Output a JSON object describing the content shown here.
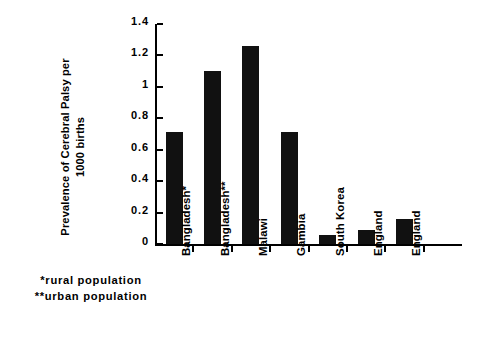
{
  "chart_data": {
    "type": "bar",
    "title": "",
    "subtitle": "",
    "xlabel": "",
    "ylabel": "Prevalence of Cerebral Palsy per\n1000 births",
    "categories": [
      "Bangladesh*",
      "Bangladesh**",
      "Malawi",
      "Gambia",
      "South Korea",
      "England",
      "England"
    ],
    "values": [
      0.71,
      1.1,
      1.26,
      0.71,
      0.06,
      0.09,
      0.16
    ],
    "ylim": [
      0,
      1.4
    ],
    "yticks": [
      0,
      0.2,
      0.4,
      0.6,
      0.8,
      1,
      1.2,
      1.4
    ],
    "ytick_labels": [
      "0",
      "0.2",
      "0.4",
      "0.6",
      "0.8",
      "1",
      "1.2",
      "1.4"
    ],
    "grid": false,
    "legend": null,
    "legend_position": "none",
    "bar_color": "#111111",
    "axis_color": "#000000",
    "background_color": "#ffffff",
    "annotations": [
      "*rural population",
      "**urban population"
    ]
  },
  "footnotes": {
    "rural": "*rural population",
    "urban": "**urban population"
  }
}
